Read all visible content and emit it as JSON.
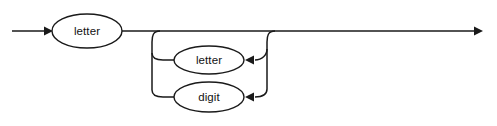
{
  "diagram": {
    "kind": "railroad-syntax-diagram",
    "canvas": {
      "width": 497,
      "height": 126,
      "background": "#ffffff"
    },
    "stroke_color": "#1a1a1a",
    "text_color": "#111111",
    "nodes": [
      {
        "id": "first-letter",
        "label": "letter",
        "cx": 87,
        "cy": 31,
        "rx": 35,
        "ry": 17
      },
      {
        "id": "loop-letter",
        "label": "letter",
        "cx": 209,
        "cy": 60,
        "rx": 35,
        "ry": 14
      },
      {
        "id": "loop-digit",
        "label": "digit",
        "cx": 209,
        "cy": 97,
        "rx": 35,
        "ry": 15
      }
    ],
    "entry_arrow": {
      "x1": 12,
      "x2": 52,
      "y": 31
    },
    "exit_arrow": {
      "x1": 272,
      "x2": 483,
      "y": 31
    },
    "main_line_y": 31,
    "loop": {
      "left_x": 152,
      "right_x": 267,
      "branch_down_x": 160,
      "rejoin_up_x": 272,
      "rows_y": [
        60,
        97
      ],
      "direction": "backward"
    },
    "semantics": {
      "reads_as": "letter ( letter | digit )*",
      "description": "An identifier begins with a letter, optionally followed by any number of letters or digits."
    }
  }
}
